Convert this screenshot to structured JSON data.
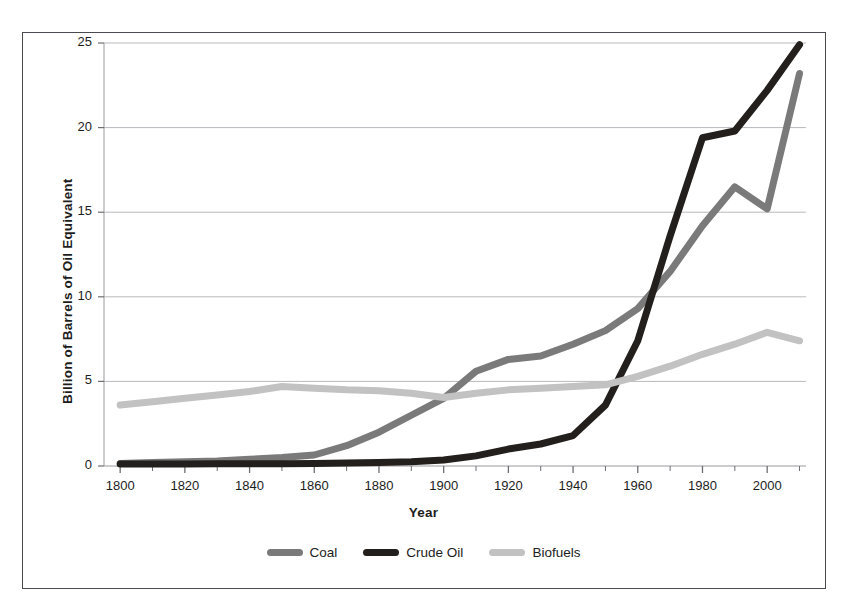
{
  "chart_data": {
    "type": "line",
    "title": "",
    "xlabel": "Year",
    "ylabel": "Billion of Barrels of Oil Equivalent",
    "xlim": [
      1795,
      2012
    ],
    "ylim": [
      0,
      25
    ],
    "grid": "horizontal",
    "legend_position": "bottom-center",
    "x": [
      1800,
      1810,
      1820,
      1830,
      1840,
      1850,
      1860,
      1870,
      1880,
      1890,
      1900,
      1910,
      1920,
      1930,
      1940,
      1950,
      1960,
      1970,
      1980,
      1990,
      2000,
      2010
    ],
    "xticks_major": [
      1800,
      1820,
      1840,
      1860,
      1880,
      1900,
      1920,
      1940,
      1960,
      1980,
      2000
    ],
    "xtick_labels": [
      "1800",
      "1820",
      "1840",
      "1860",
      "1880",
      "1900",
      "1920",
      "1940",
      "1960",
      "1980",
      "2000"
    ],
    "xtick_minor_step": 10,
    "yticks": [
      0,
      5,
      10,
      15,
      20,
      25
    ],
    "ytick_labels": [
      "0",
      "5",
      "10",
      "15",
      "20",
      "25"
    ],
    "series": [
      {
        "name": "Coal",
        "color": "#7a7a7a",
        "values": [
          0.15,
          0.2,
          0.25,
          0.3,
          0.4,
          0.5,
          0.65,
          1.2,
          2.0,
          3.0,
          4.0,
          5.6,
          6.3,
          6.5,
          7.2,
          8.0,
          9.3,
          11.5,
          14.2,
          16.5,
          15.2,
          23.2
        ]
      },
      {
        "name": "Crude Oil",
        "color": "#231f1c",
        "values": [
          0.12,
          0.12,
          0.12,
          0.13,
          0.13,
          0.14,
          0.15,
          0.17,
          0.2,
          0.25,
          0.35,
          0.6,
          1.0,
          1.3,
          1.8,
          3.6,
          7.4,
          13.6,
          19.4,
          19.8,
          22.2,
          24.9
        ]
      },
      {
        "name": "Biofuels",
        "color": "#c2c2c2",
        "values": [
          3.6,
          3.8,
          4.0,
          4.2,
          4.4,
          4.7,
          4.6,
          4.5,
          4.45,
          4.3,
          4.05,
          4.3,
          4.5,
          4.6,
          4.7,
          4.8,
          5.3,
          5.9,
          6.6,
          7.2,
          7.9,
          7.4
        ]
      }
    ]
  },
  "legend": {
    "entries": [
      {
        "label": "Coal"
      },
      {
        "label": "Crude Oil"
      },
      {
        "label": "Biofuels"
      }
    ]
  },
  "axes": {
    "x_title": "Year",
    "y_title": "Billion of Barrels of Oil Equivalent"
  }
}
